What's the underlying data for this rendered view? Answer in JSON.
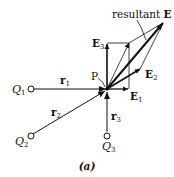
{
  "diagram": {
    "caption": "(a)",
    "point_label": "P",
    "charges": [
      {
        "name": "Q1",
        "base": "Q",
        "sub": "1"
      },
      {
        "name": "Q2",
        "base": "Q",
        "sub": "2"
      },
      {
        "name": "Q3",
        "base": "Q",
        "sub": "3"
      }
    ],
    "distances": [
      {
        "base": "r",
        "sub": "1"
      },
      {
        "base": "r",
        "sub": "2"
      },
      {
        "base": "r",
        "sub": "3"
      }
    ],
    "fields": [
      {
        "base": "E",
        "sub": "1"
      },
      {
        "base": "E",
        "sub": "2"
      },
      {
        "base": "E",
        "sub": "3"
      }
    ],
    "resultant": {
      "prefix": "resultant ",
      "symbol": "E"
    },
    "colors": {
      "stroke": "#111111",
      "background": "#ffffff"
    }
  }
}
